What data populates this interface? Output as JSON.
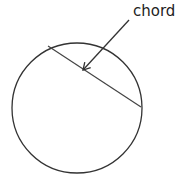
{
  "diagram": {
    "label": "chord",
    "stroke_color": "#333333",
    "circle": {
      "cx": 77,
      "cy": 108,
      "r": 65
    },
    "chord": {
      "x1": 48,
      "y1": 46,
      "x2": 141,
      "y2": 107
    },
    "arrow": {
      "x1": 129,
      "y1": 20,
      "x2": 83,
      "y2": 70
    }
  }
}
